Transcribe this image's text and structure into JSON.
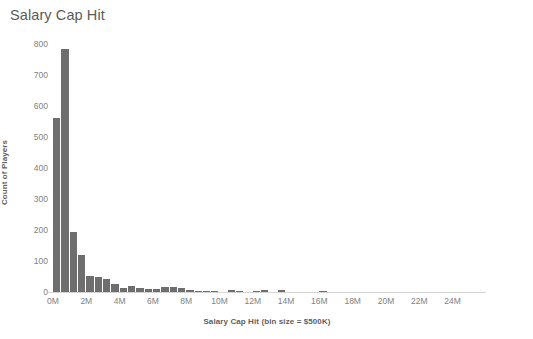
{
  "chart_data": {
    "type": "bar",
    "title": "Salary Cap Hit",
    "xlabel": "Salary Cap Hit (bin size = $500K)",
    "ylabel": "Count of Players",
    "xlim": [
      0,
      25000000
    ],
    "ylim": [
      0,
      800
    ],
    "grid": false,
    "legend": null,
    "bin_size": 500000,
    "bar_color": "#6e6e6e",
    "x_tick_labels": [
      "0M",
      "2M",
      "4M",
      "6M",
      "8M",
      "10M",
      "12M",
      "14M",
      "16M",
      "18M",
      "20M",
      "22M",
      "24M"
    ],
    "x_tick_values": [
      0,
      2000000,
      4000000,
      6000000,
      8000000,
      10000000,
      12000000,
      14000000,
      16000000,
      18000000,
      20000000,
      22000000,
      24000000
    ],
    "y_tick_labels": [
      "0",
      "100",
      "200",
      "300",
      "400",
      "500",
      "600",
      "700",
      "800"
    ],
    "y_tick_values": [
      0,
      100,
      200,
      300,
      400,
      500,
      600,
      700,
      800
    ],
    "categories": [
      "0.0M",
      "0.5M",
      "1.0M",
      "1.5M",
      "2.0M",
      "2.5M",
      "3.0M",
      "3.5M",
      "4.0M",
      "4.5M",
      "5.0M",
      "5.5M",
      "6.0M",
      "6.5M",
      "7.0M",
      "7.5M",
      "8.0M",
      "8.5M",
      "9.0M",
      "9.5M",
      "10.0M",
      "10.5M",
      "11.0M",
      "11.5M",
      "12.0M",
      "12.5M",
      "13.0M",
      "13.5M",
      "14.0M",
      "14.5M",
      "15.0M",
      "15.5M",
      "16.0M",
      "16.5M",
      "17.0M",
      "17.5M",
      "18.0M",
      "18.5M",
      "19.0M",
      "19.5M",
      "20.0M",
      "20.5M",
      "21.0M",
      "21.5M",
      "22.0M",
      "22.5M",
      "23.0M",
      "23.5M",
      "24.0M",
      "24.5M"
    ],
    "values": [
      560,
      785,
      193,
      118,
      52,
      50,
      41,
      27,
      12,
      18,
      12,
      11,
      9,
      17,
      16,
      12,
      6,
      4,
      4,
      3,
      0,
      5,
      4,
      0,
      3,
      5,
      0,
      5,
      0,
      0,
      0,
      0,
      4,
      0,
      0,
      0,
      0,
      0,
      0,
      0,
      0,
      0,
      0,
      0,
      0,
      0,
      0,
      0,
      0,
      0
    ]
  }
}
